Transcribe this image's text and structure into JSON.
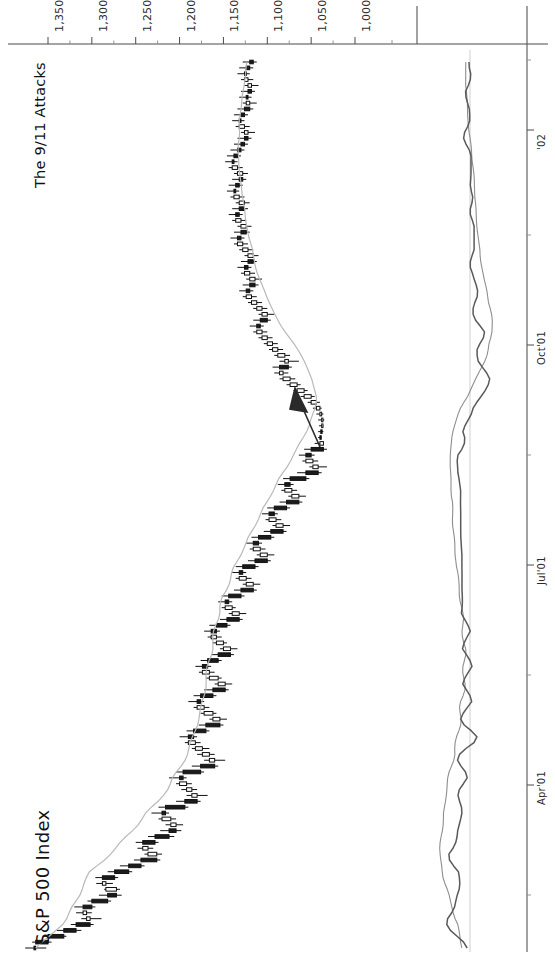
{
  "chart_title": "S&P 500 Index",
  "annotation": {
    "label": "The 9/11 Attacks",
    "arrow_name": "annotation-arrow"
  },
  "axes": {
    "price_axis_label": "",
    "price_ticks": [
      "1,350",
      "1,300",
      "1,250",
      "1,200",
      "1,150",
      "1,100",
      "1,050",
      "1,000"
    ],
    "date_ticks": [
      "Apr'01",
      "Jul'01",
      "Oct'01",
      "'02"
    ]
  },
  "colors": {
    "axis": "#4a4a4a",
    "bar_up": "#ffffff",
    "bar_down": "#1b1b1b",
    "moving_average": "#b9b9b9",
    "oscillator_fast": "#5a5a5a",
    "oscillator_slow": "#8e8e8e",
    "arrow": "#2a2a2a",
    "background": "#ffffff"
  },
  "chart_data": {
    "type": "line",
    "title": "S&P 500 Index",
    "subtitle": "The 9/11 Attacks",
    "xlabel": "",
    "ylabel": "Index level",
    "orientation": "rotated-90-ccw",
    "xlim": [
      "2001-02-01",
      "2002-01-25"
    ],
    "ylim": [
      975,
      1375
    ],
    "ytick_values": [
      1350,
      1300,
      1250,
      1200,
      1150,
      1100,
      1050,
      1000
    ],
    "ytick_labels": [
      "1,350",
      "1,300",
      "1,250",
      "1,200",
      "1,150",
      "1,100",
      "1,050",
      "1,000"
    ],
    "xtick_labels": [
      "Apr'01",
      "Jul'01",
      "Oct'01",
      "'02"
    ],
    "grid": false,
    "legend": "none",
    "annotations": [
      {
        "text": "The 9/11 Attacks",
        "points_to_value": 1038,
        "points_to_date": "2001-09-21"
      }
    ],
    "panels": [
      {
        "name": "price-panel",
        "type": "ohlc",
        "series_name": "S&P 500 Index",
        "overlay": {
          "name": "moving average",
          "type": "line",
          "color": "#b9b9b9"
        },
        "ohlc": [
          [
            1366,
            1376,
            1352,
            1364
          ],
          [
            1364,
            1368,
            1346,
            1350
          ],
          [
            1350,
            1356,
            1329,
            1332
          ],
          [
            1332,
            1340,
            1312,
            1318
          ],
          [
            1318,
            1324,
            1298,
            1302
          ],
          [
            1302,
            1312,
            1289,
            1306
          ],
          [
            1306,
            1318,
            1300,
            1310
          ],
          [
            1310,
            1320,
            1296,
            1300
          ],
          [
            1300,
            1305,
            1278,
            1282
          ],
          [
            1282,
            1292,
            1266,
            1272
          ],
          [
            1272,
            1286,
            1268,
            1284
          ],
          [
            1284,
            1295,
            1276,
            1288
          ],
          [
            1288,
            1296,
            1270,
            1274
          ],
          [
            1274,
            1282,
            1254,
            1258
          ],
          [
            1258,
            1268,
            1240,
            1244
          ],
          [
            1244,
            1252,
            1222,
            1226
          ],
          [
            1226,
            1240,
            1220,
            1236
          ],
          [
            1236,
            1248,
            1230,
            1242
          ],
          [
            1242,
            1250,
            1224,
            1228
          ],
          [
            1228,
            1236,
            1206,
            1212
          ],
          [
            1212,
            1222,
            1198,
            1204
          ],
          [
            1204,
            1216,
            1196,
            1210
          ],
          [
            1210,
            1224,
            1204,
            1220
          ],
          [
            1220,
            1232,
            1212,
            1216
          ],
          [
            1216,
            1224,
            1190,
            1194
          ],
          [
            1194,
            1204,
            1176,
            1180
          ],
          [
            1180,
            1192,
            1168,
            1186
          ],
          [
            1186,
            1198,
            1180,
            1192
          ],
          [
            1192,
            1204,
            1186,
            1200
          ],
          [
            1200,
            1212,
            1192,
            1196
          ],
          [
            1196,
            1204,
            1172,
            1176
          ],
          [
            1176,
            1186,
            1156,
            1160
          ],
          [
            1160,
            1172,
            1148,
            1166
          ],
          [
            1166,
            1180,
            1160,
            1174
          ],
          [
            1174,
            1186,
            1166,
            1182
          ],
          [
            1182,
            1194,
            1176,
            1190
          ],
          [
            1190,
            1200,
            1180,
            1184
          ],
          [
            1184,
            1192,
            1166,
            1170
          ],
          [
            1170,
            1178,
            1150,
            1154
          ],
          [
            1154,
            1166,
            1146,
            1162
          ],
          [
            1162,
            1176,
            1158,
            1172
          ],
          [
            1172,
            1184,
            1166,
            1180
          ],
          [
            1180,
            1190,
            1172,
            1176
          ],
          [
            1176,
            1184,
            1158,
            1162
          ],
          [
            1162,
            1172,
            1144,
            1148
          ],
          [
            1148,
            1160,
            1140,
            1156
          ],
          [
            1156,
            1170,
            1152,
            1166
          ],
          [
            1166,
            1178,
            1160,
            1174
          ],
          [
            1174,
            1182,
            1164,
            1168
          ],
          [
            1168,
            1176,
            1152,
            1156
          ],
          [
            1156,
            1164,
            1138,
            1142
          ],
          [
            1142,
            1154,
            1134,
            1150
          ],
          [
            1150,
            1162,
            1146,
            1158
          ],
          [
            1158,
            1168,
            1152,
            1164
          ],
          [
            1164,
            1172,
            1154,
            1158
          ],
          [
            1158,
            1166,
            1142,
            1146
          ],
          [
            1146,
            1154,
            1128,
            1132
          ],
          [
            1132,
            1144,
            1124,
            1140
          ],
          [
            1140,
            1152,
            1136,
            1148
          ],
          [
            1148,
            1156,
            1140,
            1144
          ],
          [
            1144,
            1152,
            1126,
            1130
          ],
          [
            1130,
            1138,
            1112,
            1116
          ],
          [
            1116,
            1128,
            1108,
            1124
          ],
          [
            1124,
            1136,
            1118,
            1132
          ],
          [
            1132,
            1140,
            1124,
            1128
          ],
          [
            1128,
            1136,
            1110,
            1114
          ],
          [
            1114,
            1122,
            1096,
            1100
          ],
          [
            1100,
            1112,
            1092,
            1108
          ],
          [
            1108,
            1120,
            1102,
            1116
          ],
          [
            1116,
            1124,
            1106,
            1110
          ],
          [
            1110,
            1118,
            1092,
            1096
          ],
          [
            1096,
            1104,
            1078,
            1082
          ],
          [
            1082,
            1094,
            1074,
            1090
          ],
          [
            1090,
            1102,
            1084,
            1098
          ],
          [
            1098,
            1106,
            1088,
            1092
          ],
          [
            1092,
            1100,
            1074,
            1078
          ],
          [
            1078,
            1086,
            1060,
            1064
          ],
          [
            1064,
            1076,
            1056,
            1072
          ],
          [
            1072,
            1084,
            1066,
            1080
          ],
          [
            1080,
            1088,
            1070,
            1074
          ],
          [
            1074,
            1082,
            1052,
            1056
          ],
          [
            1056,
            1066,
            1038,
            1042
          ],
          [
            1042,
            1052,
            1032,
            1048
          ],
          [
            1048,
            1060,
            1042,
            1056
          ],
          [
            1056,
            1064,
            1046,
            1050
          ],
          [
            1050,
            1058,
            1032,
            1036
          ],
          [
            1036,
            1046,
            1038,
            1040
          ],
          [
            1040,
            1042,
            1038,
            1039
          ],
          [
            1039,
            1042,
            1036,
            1038
          ],
          [
            1038,
            1041,
            1036,
            1038
          ],
          [
            1038,
            1042,
            1035,
            1038
          ],
          [
            1038,
            1044,
            1036,
            1040
          ],
          [
            1040,
            1048,
            1038,
            1044
          ],
          [
            1044,
            1054,
            1040,
            1050
          ],
          [
            1050,
            1062,
            1046,
            1058
          ],
          [
            1058,
            1070,
            1054,
            1066
          ],
          [
            1066,
            1078,
            1062,
            1074
          ],
          [
            1074,
            1086,
            1068,
            1082
          ],
          [
            1082,
            1092,
            1076,
            1086
          ],
          [
            1086,
            1094,
            1072,
            1076
          ],
          [
            1076,
            1086,
            1064,
            1080
          ],
          [
            1080,
            1092,
            1074,
            1088
          ],
          [
            1088,
            1098,
            1082,
            1094
          ],
          [
            1094,
            1104,
            1088,
            1100
          ],
          [
            1100,
            1110,
            1094,
            1106
          ],
          [
            1106,
            1116,
            1100,
            1112
          ],
          [
            1112,
            1120,
            1104,
            1108
          ],
          [
            1108,
            1116,
            1096,
            1100
          ],
          [
            1100,
            1110,
            1092,
            1106
          ],
          [
            1106,
            1116,
            1100,
            1112
          ],
          [
            1112,
            1122,
            1106,
            1118
          ],
          [
            1118,
            1128,
            1112,
            1124
          ],
          [
            1124,
            1132,
            1116,
            1120
          ],
          [
            1120,
            1128,
            1110,
            1114
          ],
          [
            1114,
            1124,
            1106,
            1120
          ],
          [
            1120,
            1130,
            1114,
            1126
          ],
          [
            1126,
            1134,
            1118,
            1122
          ],
          [
            1122,
            1130,
            1112,
            1116
          ],
          [
            1116,
            1126,
            1110,
            1122
          ],
          [
            1122,
            1132,
            1116,
            1128
          ],
          [
            1128,
            1138,
            1122,
            1134
          ],
          [
            1134,
            1142,
            1126,
            1130
          ],
          [
            1130,
            1138,
            1120,
            1124
          ],
          [
            1124,
            1134,
            1118,
            1130
          ],
          [
            1130,
            1140,
            1124,
            1136
          ],
          [
            1136,
            1144,
            1128,
            1132
          ],
          [
            1132,
            1140,
            1122,
            1126
          ],
          [
            1126,
            1136,
            1120,
            1132
          ],
          [
            1132,
            1142,
            1126,
            1138
          ],
          [
            1138,
            1146,
            1132,
            1136
          ],
          [
            1136,
            1144,
            1128,
            1132
          ],
          [
            1132,
            1140,
            1124,
            1128
          ],
          [
            1128,
            1138,
            1122,
            1134
          ],
          [
            1134,
            1144,
            1128,
            1140
          ],
          [
            1140,
            1148,
            1134,
            1138
          ],
          [
            1138,
            1146,
            1130,
            1134
          ],
          [
            1134,
            1142,
            1126,
            1130
          ],
          [
            1130,
            1138,
            1122,
            1126
          ],
          [
            1126,
            1134,
            1118,
            1122
          ],
          [
            1122,
            1130,
            1114,
            1126
          ],
          [
            1126,
            1136,
            1120,
            1132
          ],
          [
            1132,
            1140,
            1126,
            1130
          ],
          [
            1130,
            1138,
            1122,
            1126
          ],
          [
            1126,
            1134,
            1116,
            1120
          ],
          [
            1120,
            1128,
            1112,
            1124
          ],
          [
            1124,
            1132,
            1118,
            1122
          ],
          [
            1122,
            1130,
            1114,
            1118
          ],
          [
            1118,
            1126,
            1110,
            1122
          ],
          [
            1122,
            1130,
            1116,
            1126
          ],
          [
            1126,
            1134,
            1120,
            1124
          ],
          [
            1124,
            1132,
            1116,
            1120
          ],
          [
            1120,
            1128,
            1112,
            1116
          ]
        ]
      },
      {
        "name": "indicator-panel",
        "type": "line",
        "series": [
          {
            "name": "oscillator-fast",
            "color": "#5a5a5a"
          },
          {
            "name": "oscillator-slow",
            "color": "#8e8e8e"
          }
        ]
      }
    ]
  }
}
